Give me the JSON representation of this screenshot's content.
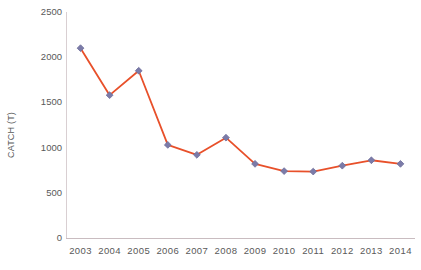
{
  "chart_data": {
    "type": "line",
    "title": "",
    "xlabel": "",
    "ylabel": "CATCH (T)",
    "categories": [
      "2003",
      "2004",
      "2005",
      "2006",
      "2007",
      "2008",
      "2009",
      "2010",
      "2011",
      "2012",
      "2013",
      "2014"
    ],
    "values": [
      2100,
      1580,
      1850,
      1030,
      920,
      1110,
      820,
      740,
      735,
      800,
      860,
      820
    ],
    "series": [
      {
        "name": "CATCH (T)",
        "values": [
          2100,
          1580,
          1850,
          1030,
          920,
          1110,
          820,
          740,
          735,
          800,
          860,
          820
        ]
      }
    ],
    "ylim": [
      0,
      2500
    ],
    "y_ticks": [
      "0",
      "500",
      "1000",
      "1500",
      "2000",
      "2500"
    ],
    "y_tick_values": [
      0,
      500,
      1000,
      1500,
      2000,
      2500
    ],
    "x_ticks": [
      "2003",
      "2004",
      "2005",
      "2006",
      "2007",
      "2008",
      "2009",
      "2010",
      "2011",
      "2012",
      "2013",
      "2014"
    ],
    "grid": false,
    "legend": "none",
    "marker": "diamond",
    "line_color": "#E8502A",
    "marker_color": "#7B7BA8",
    "marker_edge_color": "#6E6E9C",
    "axis_color": "#C9BCC0",
    "text_color": "#595959"
  }
}
